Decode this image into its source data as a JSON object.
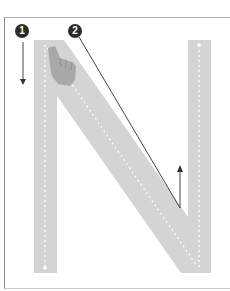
{
  "worksheet": {
    "letter": "N",
    "steps": [
      {
        "number": "1",
        "direction": "down"
      },
      {
        "number": "2",
        "direction": "diagonal-down-right-then-up"
      }
    ],
    "colors": {
      "letter_fill": "#d4d4d4",
      "guide_dots": "#ffffff",
      "badge": "#2b2b2b",
      "arrow": "#444444"
    }
  }
}
